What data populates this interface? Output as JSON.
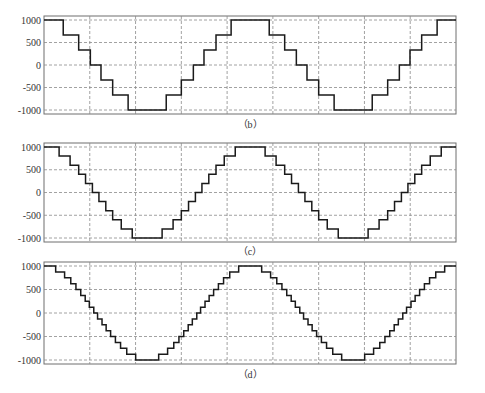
{
  "chart_data": [
    {
      "type": "line",
      "caption": "（b）",
      "title": "",
      "xlabel": "",
      "ylabel": "",
      "ylim": [
        -1000,
        1000
      ],
      "yticks": [
        "1000",
        "500",
        "0",
        "-500",
        "-1000"
      ],
      "xticks": [],
      "grid": true,
      "legend": null,
      "description": "Staircase approximation of a cosine wave, 7 quantization levels, 2 periods",
      "series": [
        {
          "name": "staircase",
          "levels": [
            1000,
            667,
            333,
            0,
            -333,
            -667,
            -1000
          ],
          "periods": 2
        }
      ]
    },
    {
      "type": "line",
      "caption": "（c）",
      "title": "",
      "xlabel": "",
      "ylabel": "",
      "ylim": [
        -1000,
        1000
      ],
      "yticks": [
        "1000",
        "500",
        "0",
        "-500",
        "-1000"
      ],
      "xticks": [],
      "grid": true,
      "legend": null,
      "description": "Staircase approximation of a cosine wave, 11 quantization levels, 2 periods",
      "series": [
        {
          "name": "staircase",
          "levels": [
            1000,
            800,
            600,
            400,
            200,
            0,
            -200,
            -400,
            -600,
            -800,
            -1000
          ],
          "periods": 2
        }
      ]
    },
    {
      "type": "line",
      "caption": "（d）",
      "title": "",
      "xlabel": "",
      "ylabel": "",
      "ylim": [
        -1000,
        1000
      ],
      "yticks": [
        "1000",
        "500",
        "0",
        "-500",
        "-1000"
      ],
      "xticks": [],
      "grid": true,
      "legend": null,
      "description": "Staircase approximation of a cosine wave, 17 quantization levels, 2 periods",
      "series": [
        {
          "name": "staircase",
          "levels": [
            1000,
            875,
            750,
            625,
            500,
            375,
            250,
            125,
            0,
            -125,
            -250,
            -375,
            -500,
            -625,
            -750,
            -875,
            -1000
          ],
          "periods": 2
        }
      ]
    }
  ],
  "colors": {
    "line": "#1a1a1a",
    "grid": "#8a8a8a",
    "frame": "#6f6f6f"
  }
}
